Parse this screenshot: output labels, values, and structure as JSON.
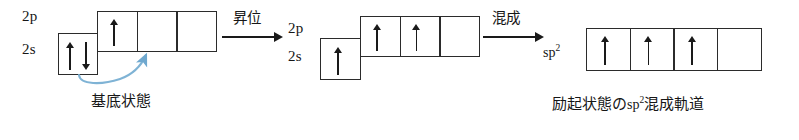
{
  "diagram": {
    "colors": {
      "line": "#2b2b2b",
      "arrow_black": "#1a1a1a",
      "promotion_curve": "#7fb3d5",
      "background": "#ffffff"
    },
    "groups": [
      {
        "id": "ground-state",
        "caption": "基底状態",
        "labels": {
          "p": "2p",
          "s": "2s"
        },
        "s_orbital": {
          "name": "2s",
          "boxes": 1,
          "electrons": [
            [
              "up",
              "down"
            ]
          ]
        },
        "p_orbital": {
          "name": "2p",
          "boxes": 3,
          "electrons": [
            [
              "up"
            ],
            [],
            []
          ]
        }
      },
      {
        "id": "excited-state",
        "caption": "",
        "labels": {
          "p": "2p",
          "s": "2s"
        },
        "s_orbital": {
          "name": "2s",
          "boxes": 1,
          "electrons": [
            [
              "up"
            ]
          ]
        },
        "p_orbital": {
          "name": "2p",
          "boxes": 3,
          "electrons": [
            [
              "up"
            ],
            [
              "up"
            ],
            []
          ]
        }
      },
      {
        "id": "hybrid-state",
        "caption_prefix": "励起状態の",
        "caption_sp": "sp",
        "caption_sup": "2",
        "caption_suffix": "混成軌道",
        "caption_full": "励起状態のsp2混成軌道",
        "labels": {
          "hybrid": "sp",
          "hybrid_sup": "2"
        },
        "hybrid_orbital": {
          "name": "sp2",
          "boxes": 4,
          "electrons": [
            [
              "up"
            ],
            [
              "up"
            ],
            [
              "up"
            ],
            []
          ]
        }
      }
    ],
    "transitions": [
      {
        "id": "promotion",
        "label": "昇位",
        "icon": "right-arrow-icon"
      },
      {
        "id": "hybridization",
        "label": "混成",
        "icon": "right-arrow-icon"
      }
    ],
    "curved_arrow": {
      "id": "electron-promotion-curve",
      "description": "curved arrow from 2s orbital to second 2p orbital",
      "color": "#7fb3d5"
    }
  }
}
